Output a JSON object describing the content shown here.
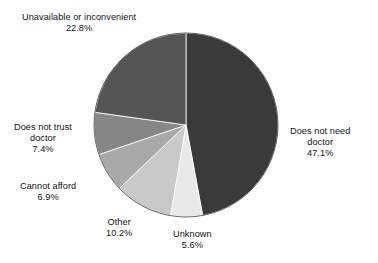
{
  "chart_data": {
    "type": "pie",
    "title": "",
    "subtitle": "",
    "xlabel": "",
    "ylabel": "",
    "legend_position": "none",
    "grid": false,
    "labels_show_percent": true,
    "start_angle_deg": 0,
    "direction": "clockwise",
    "categories": [
      "Does not need doctor",
      "Unknown",
      "Other",
      "Cannot afford",
      "Does not trust doctor",
      "Unavailable or inconvenient"
    ],
    "values": [
      47.1,
      5.6,
      10.2,
      6.9,
      7.4,
      22.8
    ],
    "value_labels": [
      "47.1%",
      "5.6%",
      "10.2%",
      "6.9%",
      "7.4%",
      "22.8%"
    ],
    "colors": [
      "#3a3a3a",
      "#e9e9e9",
      "#c9c9c9",
      "#a9a9a9",
      "#868686",
      "#555555"
    ],
    "slices": [
      {
        "name": "Does not need doctor",
        "label_line1": "Does not need",
        "label_line2": "doctor",
        "value": 47.1,
        "value_label": "47.1%",
        "color": "#3a3a3a"
      },
      {
        "name": "Unknown",
        "label_line1": "Unknown",
        "label_line2": "",
        "value": 5.6,
        "value_label": "5.6%",
        "color": "#e9e9e9"
      },
      {
        "name": "Other",
        "label_line1": "Other",
        "label_line2": "",
        "value": 10.2,
        "value_label": "10.2%",
        "color": "#c9c9c9"
      },
      {
        "name": "Cannot afford",
        "label_line1": "Cannot afford",
        "label_line2": "",
        "value": 6.9,
        "value_label": "6.9%",
        "color": "#a9a9a9"
      },
      {
        "name": "Does not trust doctor",
        "label_line1": "Does not trust",
        "label_line2": "doctor",
        "value": 7.4,
        "value_label": "7.4%",
        "color": "#868686"
      },
      {
        "name": "Unavailable or inconvenient",
        "label_line1": "Unavailable or inconvenient",
        "label_line2": "",
        "value": 22.8,
        "value_label": "22.8%",
        "color": "#555555"
      }
    ]
  },
  "geometry": {
    "center_x": 186,
    "center_y": 125,
    "radius": 92
  }
}
